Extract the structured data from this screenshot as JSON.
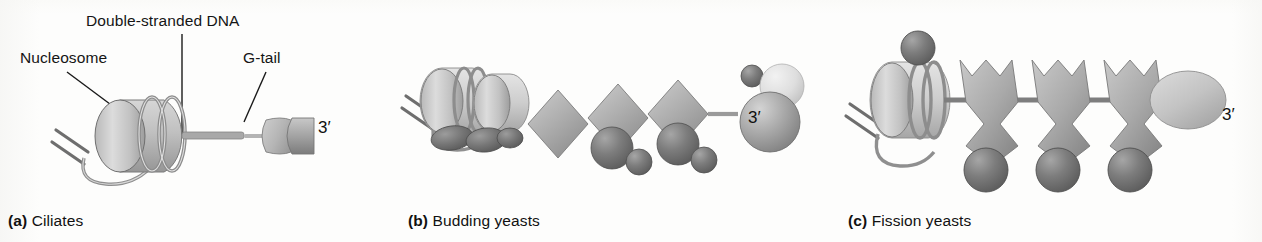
{
  "figure": {
    "background_color": "#fdfdfc",
    "text_color": "#151515",
    "width": 1262,
    "height": 242
  },
  "palette": {
    "nucleosome_light": "#cfcfcf",
    "nucleosome_mid": "#b2b2b2",
    "protein_mid_grey": "#a8a8a8",
    "protein_dark_grey": "#6f6f6f",
    "protein_pale": "#e2e2e2",
    "dna_strand": "#8f8f8f",
    "outline": "#5a5a5a",
    "leader_line": "#1a1a1a"
  },
  "panels": [
    {
      "id": "a",
      "tag": "(a)",
      "caption_text": "Ciliates",
      "prime_end_label": "3′",
      "labels": [
        {
          "name": "double-stranded-dna",
          "text": "Double-stranded DNA"
        },
        {
          "name": "nucleosome",
          "text": "Nucleosome"
        },
        {
          "name": "g-tail",
          "text": "G-tail"
        }
      ],
      "elements": {
        "nucleosome_count": 1,
        "dna_linker": true,
        "gtail_cap": "rounded cap plus rectangular block",
        "end_complex": "single capped G-tail terminus"
      }
    },
    {
      "id": "b",
      "tag": "(b)",
      "caption_text": "Budding yeasts",
      "prime_end_label": "3′",
      "labels": [],
      "elements": {
        "nucleosome_count": 2,
        "dark_lobe_count": 3,
        "diamond_unit_count": 3,
        "dark_sphere_pairs": 2,
        "end_complex": "large mid-grey sphere with pale sphere and small dark sphere"
      }
    },
    {
      "id": "c",
      "tag": "(c)",
      "caption_text": "Fission yeasts",
      "prime_end_label": "3′",
      "labels": [],
      "elements": {
        "nucleosome_count": 1,
        "top_dark_sphere": true,
        "repeat_unit_count": 3,
        "repeat_unit_shape": "notched double-lobed cap with dark sphere below",
        "end_complex": "single pale ellipse"
      }
    }
  ]
}
